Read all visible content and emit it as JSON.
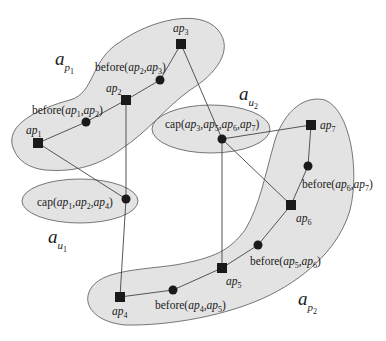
{
  "diagram": {
    "regions": {
      "ap1": {
        "label": "a",
        "sub": "p",
        "subsub": "1"
      },
      "ap2": {
        "label": "a",
        "sub": "p",
        "subsub": "2"
      },
      "au1": {
        "label": "a",
        "sub": "u",
        "subsub": "1"
      },
      "au2": {
        "label": "a",
        "sub": "u",
        "subsub": "2"
      }
    },
    "nodes": {
      "ap1": {
        "base": "ap",
        "idx": "1"
      },
      "ap2": {
        "base": "ap",
        "idx": "2"
      },
      "ap3": {
        "base": "ap",
        "idx": "3"
      },
      "ap4": {
        "base": "ap",
        "idx": "4"
      },
      "ap5": {
        "base": "ap",
        "idx": "5"
      },
      "ap6": {
        "base": "ap",
        "idx": "6"
      },
      "ap7": {
        "base": "ap",
        "idx": "7"
      }
    },
    "relations": {
      "before12": {
        "fn": "before(",
        "a": "ap",
        "ai": "1",
        "sep": ",",
        "b": "ap",
        "bi": "2",
        "close": ")"
      },
      "before23": {
        "fn": "before(",
        "a": "ap",
        "ai": "2",
        "sep": ",",
        "b": "ap",
        "bi": "3",
        "close": ")"
      },
      "before45": {
        "fn": "before(",
        "a": "ap",
        "ai": "4",
        "sep": ",",
        "b": "ap",
        "bi": "5",
        "close": ")"
      },
      "before56": {
        "fn": "before(",
        "a": "ap",
        "ai": "5",
        "sep": ",",
        "b": "ap",
        "bi": "6",
        "close": ")"
      },
      "before67": {
        "fn": "before(",
        "a": "ap",
        "ai": "6",
        "sep": ",",
        "b": "ap",
        "bi": "7",
        "close": ")"
      },
      "cap124": {
        "fn": "cap(",
        "args": [
          [
            "ap",
            "1"
          ],
          [
            "ap",
            "2"
          ],
          [
            "ap",
            "4"
          ]
        ],
        "close": ")"
      },
      "cap3567": {
        "fn": "cap(",
        "args": [
          [
            "ap",
            "3"
          ],
          [
            "ap",
            "5"
          ],
          [
            "ap",
            "6"
          ],
          [
            "ap",
            "7"
          ]
        ],
        "close": ")"
      }
    },
    "colors": {
      "region_fill": "#e3e3e3",
      "stroke": "#555555",
      "node": "#1a1a1a"
    }
  }
}
